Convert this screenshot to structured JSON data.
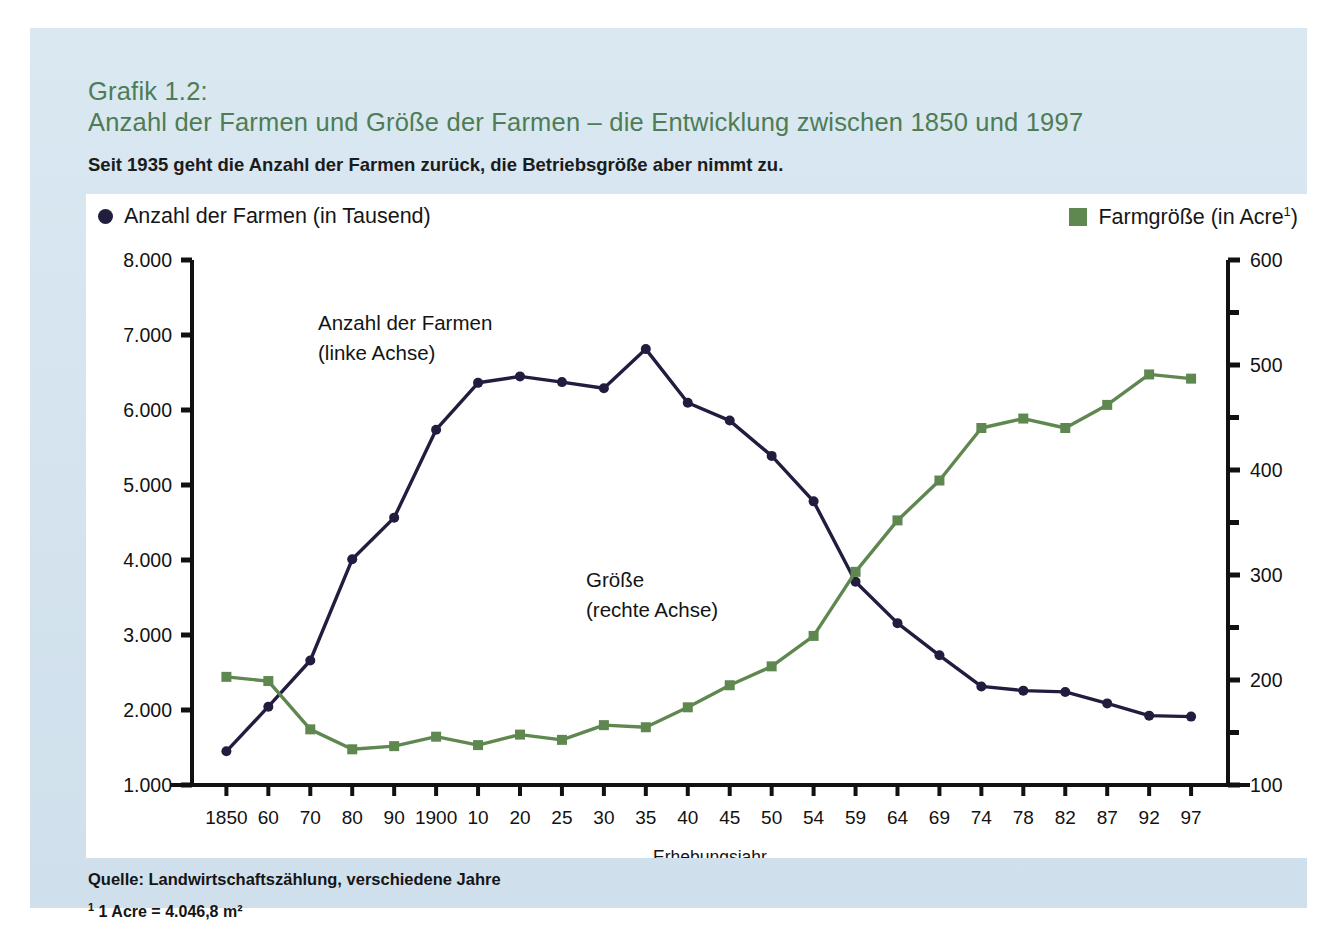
{
  "header": {
    "figure_label": "Grafik 1.2:",
    "title": "Anzahl der Farmen und Größe der Farmen – die Entwicklung zwischen 1850 und 1997",
    "subtitle": "Seit 1935 geht die Anzahl der Farmen zurück, die Betriebsgröße aber nimmt zu."
  },
  "legend": {
    "farms": {
      "label": "Anzahl der Farmen (in Tausend)",
      "marker": "circle-marker-icon",
      "color": "#211d3f"
    },
    "size": {
      "label_main": "Farmgröße (in Acre",
      "label_sup": "1",
      "label_end": ")",
      "marker": "square-marker-icon",
      "color": "#5f8750"
    }
  },
  "annotations": {
    "left_series_line1": "Anzahl der Farmen",
    "left_series_line2": "(linke Achse)",
    "right_series_line1": "Größe",
    "right_series_line2": "(rechte Achse)"
  },
  "footer": {
    "source": "Quelle: Landwirtschaftszählung, verschiedene Jahre",
    "footnote_marker": "1",
    "footnote_text": " 1 Acre = 4.046,8 m²"
  },
  "chart_data": {
    "type": "line",
    "title": "Anzahl der Farmen und Größe der Farmen – die Entwicklung zwischen 1850 und 1997",
    "xlabel": "Erhebungsjahr",
    "grid": false,
    "legend_position": "top",
    "categories": [
      "1850",
      "60",
      "70",
      "80",
      "90",
      "1900",
      "10",
      "20",
      "25",
      "30",
      "35",
      "40",
      "45",
      "50",
      "54",
      "59",
      "64",
      "69",
      "74",
      "78",
      "82",
      "87",
      "92",
      "97"
    ],
    "left_axis": {
      "label": "Anzahl der Farmen (in Tausend)",
      "ylim": [
        1000,
        8000
      ],
      "ticks": [
        "1.000",
        "2.000",
        "3.000",
        "4.000",
        "5.000",
        "6.000",
        "7.000",
        "8.000"
      ],
      "tick_values": [
        1000,
        2000,
        3000,
        4000,
        5000,
        6000,
        7000,
        8000
      ]
    },
    "right_axis": {
      "label": "Farmgröße (in Acre)",
      "ylim": [
        100,
        600
      ],
      "ticks": [
        "100",
        "200",
        "300",
        "400",
        "500",
        "600"
      ],
      "tick_values": [
        100,
        200,
        300,
        400,
        500,
        600
      ],
      "minor_tick_step": 50
    },
    "series": [
      {
        "name": "Anzahl der Farmen (in Tausend)",
        "axis": "left",
        "color": "#211d3f",
        "marker": "circle",
        "values": [
          1449,
          2044,
          2660,
          4009,
          4565,
          5737,
          6362,
          6448,
          6372,
          6289,
          6812,
          6097,
          5859,
          5388,
          4782,
          3711,
          3158,
          2730,
          2314,
          2258,
          2241,
          2088,
          1925,
          1912
        ]
      },
      {
        "name": "Farmgröße (in Acre)",
        "axis": "right",
        "color": "#5f8750",
        "marker": "square",
        "values": [
          203,
          199,
          153,
          134,
          137,
          146,
          138,
          148,
          143,
          157,
          155,
          174,
          195,
          213,
          242,
          303,
          352,
          390,
          440,
          449,
          440,
          462,
          491,
          487
        ]
      }
    ]
  }
}
